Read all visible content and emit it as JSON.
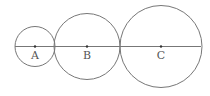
{
  "diagram": {
    "stroke_color": "#777777",
    "line": {
      "x1": 15,
      "x2": 201,
      "y": 46.5
    },
    "circles": [
      {
        "label": "A",
        "cx": 35,
        "cy": 46.5,
        "r": 20
      },
      {
        "label": "B",
        "cx": 87,
        "cy": 46.5,
        "r": 33
      },
      {
        "label": "C",
        "cx": 161,
        "cy": 46.5,
        "r": 41
      }
    ]
  }
}
